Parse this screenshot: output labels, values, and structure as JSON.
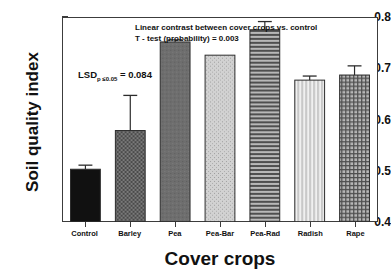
{
  "chart_data": {
    "type": "bar",
    "title": "",
    "xlabel": "Cover crops",
    "ylabel": "Soil quality index",
    "ylim": [
      0.4,
      0.8
    ],
    "yticks": [
      "0.4",
      "0.5",
      "0.6",
      "0.7",
      "0.8"
    ],
    "ytick_values": [
      0.4,
      0.5,
      0.6,
      0.7,
      0.8
    ],
    "grid": false,
    "legend": "none",
    "categories": [
      "Control",
      "Barley",
      "Pea",
      "Pea-Bar",
      "Pea-Rad",
      "Radish",
      "Rape"
    ],
    "values": [
      0.503,
      0.579,
      0.753,
      0.727,
      0.777,
      0.678,
      0.688
    ],
    "errors": [
      0.008,
      0.069,
      0.004,
      0.0,
      0.016,
      0.008,
      0.018
    ],
    "bar_fills": [
      "solid-black",
      "dark-checker",
      "dark-gray-solid",
      "light-speckle",
      "horizontal-lines",
      "vertical-lines",
      "cross-hatch"
    ],
    "annotations": [
      "Linear contrast between cover crops vs. control",
      "T - test (probability) = 0.003",
      "LSD",
      "p ≤0.05",
      "= 0.084"
    ]
  },
  "axis": {
    "y_title": "Soil quality index",
    "x_title": "Cover crops"
  },
  "annotation": {
    "contrast_line1": "Linear contrast between cover crops vs. control",
    "contrast_line2": "T - test (probability) = 0.003",
    "lsd_label": "LSD",
    "lsd_sub": "p ≤0.05",
    "lsd_value": "= 0.084"
  },
  "colors": {
    "axis": "#3c3c3c",
    "text": "#111111",
    "bar_outline": "#2b2b2b",
    "control": "#111111",
    "barley": "#6f6f6f",
    "pea": "#6e6e6e",
    "pea_bar": "#c9c9c9",
    "pea_rad": "#8a8a8a",
    "radish": "#dcdcdc",
    "rape": "#9a9a9a"
  }
}
